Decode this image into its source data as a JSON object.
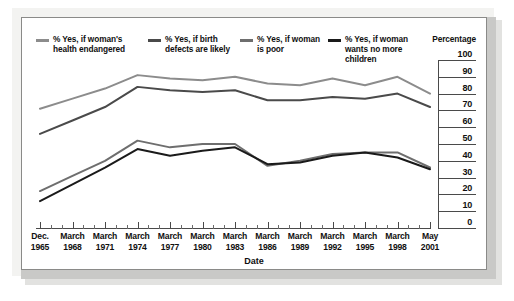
{
  "chart_data": {
    "type": "line",
    "title": "",
    "xlabel": "Date",
    "ylabel": "Percentage",
    "ylim": [
      0,
      100
    ],
    "ytick_step": 10,
    "grid": true,
    "legend_position": "top",
    "yticks": [
      "100",
      "90",
      "80",
      "70",
      "60",
      "50",
      "40",
      "30",
      "20",
      "10",
      "0"
    ],
    "categories": [
      "Dec.\n1965",
      "March\n1968",
      "March\n1971",
      "March\n1974",
      "March\n1977",
      "March\n1980",
      "March\n1983",
      "March\n1986",
      "March\n1989",
      "March\n1992",
      "March\n1995",
      "March\n1998",
      "May\n2001"
    ],
    "series": [
      {
        "name": "% Yes, if woman's\nhealth endangered",
        "color": "#8c8c8c",
        "values": [
          71,
          77,
          83,
          91,
          89,
          88,
          90,
          86,
          85,
          89,
          85,
          90,
          80
        ]
      },
      {
        "name": "% Yes, if birth\ndefects are likely",
        "color": "#4a4a4a",
        "values": [
          56,
          64,
          72,
          84,
          82,
          81,
          82,
          76,
          76,
          78,
          77,
          80,
          72
        ]
      },
      {
        "name": "% Yes, if woman\nis poor",
        "color": "#6e6e6e",
        "values": [
          22,
          31,
          40,
          52,
          48,
          50,
          50,
          37,
          40,
          44,
          45,
          45,
          36
        ]
      },
      {
        "name": "% Yes, if woman\nwants no more\nchildren",
        "color": "#1a1a1a",
        "values": [
          16,
          26,
          36,
          47,
          43,
          46,
          48,
          38,
          39,
          43,
          45,
          42,
          35
        ]
      }
    ]
  },
  "legend": {
    "unit_label": "Percentage"
  },
  "axis": {
    "x_title": "Date"
  }
}
